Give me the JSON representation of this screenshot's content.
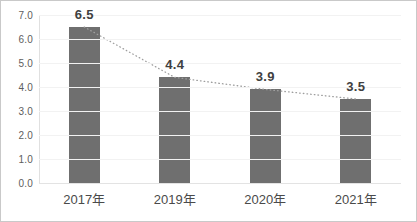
{
  "chart_data": {
    "type": "bar",
    "title": "",
    "subtitle": "",
    "xlabel": "",
    "ylabel": "",
    "categories": [
      "2017年",
      "2019年",
      "2020年",
      "2021年"
    ],
    "values": [
      6.5,
      4.4,
      3.9,
      3.5
    ],
    "data_labels": [
      "6.5",
      "4.4",
      "3.9",
      "3.5"
    ],
    "ylim": [
      0.0,
      7.0
    ],
    "ystep": 1.0,
    "ytick_labels": [
      "0.0",
      "1.0",
      "2.0",
      "3.0",
      "4.0",
      "5.0",
      "6.0",
      "7.0"
    ],
    "grid": true,
    "legend": "none",
    "series": [
      {
        "name": "bars",
        "type": "bar",
        "color": "#6f6f6f",
        "values": [
          6.5,
          4.4,
          3.9,
          3.5
        ]
      },
      {
        "name": "trend",
        "type": "line",
        "style": "dotted",
        "color": "#9e9e9e",
        "values": [
          6.5,
          4.4,
          3.9,
          3.5
        ]
      }
    ],
    "colors": {
      "bar": "#6f6f6f",
      "trendline": "#9e9e9e",
      "gridline": "#f2f2f2",
      "border": "#c9c9c9",
      "axis_text": "#5d5d5d",
      "label_text": "#404040",
      "background": "#ffffff"
    }
  }
}
